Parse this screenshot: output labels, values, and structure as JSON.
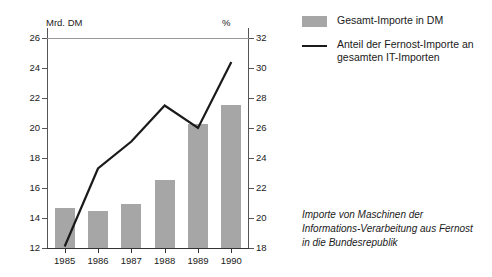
{
  "chart_data": {
    "type": "bar",
    "title": "",
    "categories": [
      "1985",
      "1986",
      "1987",
      "1988",
      "1989",
      "1990"
    ],
    "series": [
      {
        "name": "Gesamt-Importe in DM",
        "type": "bar",
        "axis": "left",
        "unit": "Mrd. DM",
        "values": [
          14.7,
          14.45,
          14.95,
          16.55,
          20.3,
          21.55
        ]
      },
      {
        "name": "Anteil der Fernost-Importe an gesamten IT-Importen",
        "type": "line",
        "axis": "right",
        "unit": "%",
        "values": [
          18.1,
          23.3,
          25.1,
          27.5,
          26.0,
          30.4
        ]
      }
    ],
    "xlabel": "",
    "ylabel": "Mrd. DM",
    "y2label": "%",
    "ylim": [
      12,
      26
    ],
    "y2lim": [
      18,
      32
    ],
    "yticks": [
      12,
      14,
      16,
      18,
      20,
      22,
      24,
      26
    ],
    "y2ticks": [
      18,
      20,
      22,
      24,
      26,
      28,
      30,
      32
    ],
    "grid": false,
    "legend_position": "right"
  },
  "axes": {
    "left_unit": "Mrd. DM",
    "right_unit": "%",
    "left_ticks": [
      "26",
      "24",
      "22",
      "20",
      "18",
      "16",
      "14",
      "12"
    ],
    "right_ticks": [
      "32",
      "30",
      "28",
      "26",
      "24",
      "22",
      "20",
      "18"
    ],
    "x_ticks": [
      "1985",
      "1986",
      "1987",
      "1988",
      "1989",
      "1990"
    ]
  },
  "legend": {
    "items": [
      {
        "marker": "bar-swatch",
        "label": "Gesamt-Importe in DM"
      },
      {
        "marker": "line-swatch",
        "label": "Anteil der Fernost-Importe an gesamten IT-Importen"
      }
    ]
  },
  "caption": {
    "text": "Importe von Maschinen der Informations-Verarbeitung aus Fernost in die Bundesrepublik"
  },
  "colors": {
    "bar_fill": "#a6a6a6",
    "line_stroke": "#1a1a1a",
    "axis": "#555555",
    "background": "#ffffff"
  }
}
